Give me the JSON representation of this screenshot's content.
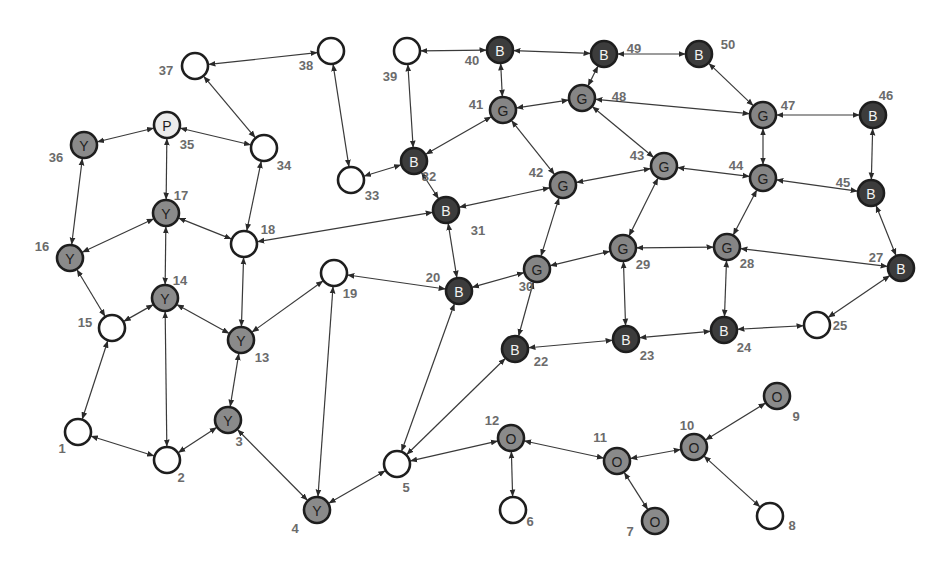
{
  "diagram": {
    "type": "undirected-graph-bidirectional-arrows",
    "node_radius": 13,
    "styles": {
      "Y": {
        "fill": "#8a8a8a",
        "stroke": "#1e1e1e",
        "text": "#1e1e1e"
      },
      "G": {
        "fill": "#858585",
        "stroke": "#1e1e1e",
        "text": "#1e1e1e"
      },
      "G-light": {
        "fill": "#8f8f8f",
        "stroke": "#8a8a8a",
        "text": "#1e1e1e"
      },
      "B": {
        "fill": "#3c3c3c",
        "stroke": "#1e1e1e",
        "text": "#f2f2f2"
      },
      "O": {
        "fill": "#8a8a8a",
        "stroke": "#1e1e1e",
        "text": "#1e1e1e"
      },
      "P": {
        "fill": "#ececec",
        "stroke": "#1e1e1e",
        "text": "#1e1e1e"
      },
      "empty": {
        "fill": "#ffffff",
        "stroke": "#1e1e1e",
        "text": "#1e1e1e"
      }
    },
    "nodes": [
      {
        "id": 1,
        "x": 78,
        "y": 432,
        "letter": "",
        "style": "empty",
        "lx": -16,
        "ly": 16
      },
      {
        "id": 2,
        "x": 167,
        "y": 460,
        "letter": "",
        "style": "empty",
        "lx": 14,
        "ly": 17
      },
      {
        "id": 3,
        "x": 228,
        "y": 420,
        "letter": "Y",
        "style": "Y",
        "lx": 11,
        "ly": 21
      },
      {
        "id": 4,
        "x": 317,
        "y": 510,
        "letter": "Y",
        "style": "Y",
        "lx": -22,
        "ly": 18
      },
      {
        "id": 5,
        "x": 397,
        "y": 464,
        "letter": "",
        "style": "empty",
        "lx": 9,
        "ly": 23
      },
      {
        "id": 6,
        "x": 513,
        "y": 510,
        "letter": "",
        "style": "empty",
        "lx": 17,
        "ly": 11
      },
      {
        "id": 7,
        "x": 655,
        "y": 521,
        "letter": "O",
        "style": "O",
        "lx": -25,
        "ly": 10
      },
      {
        "id": 8,
        "x": 770,
        "y": 516,
        "letter": "",
        "style": "empty",
        "lx": 22,
        "ly": 9
      },
      {
        "id": 9,
        "x": 777,
        "y": 396,
        "letter": "O",
        "style": "O",
        "lx": 19,
        "ly": 20
      },
      {
        "id": 10,
        "x": 694,
        "y": 447,
        "letter": "O",
        "style": "O",
        "lx": -7,
        "ly": -22
      },
      {
        "id": 11,
        "x": 617,
        "y": 461,
        "letter": "O",
        "style": "O",
        "lx": -17,
        "ly": -24
      },
      {
        "id": 12,
        "x": 511,
        "y": 438,
        "letter": "O",
        "style": "O",
        "lx": -19,
        "ly": -18
      },
      {
        "id": 13,
        "x": 241,
        "y": 340,
        "letter": "Y",
        "style": "Y",
        "lx": 21,
        "ly": 17
      },
      {
        "id": 14,
        "x": 165,
        "y": 298,
        "letter": "Y",
        "style": "Y",
        "lx": 15,
        "ly": -18
      },
      {
        "id": 15,
        "x": 112,
        "y": 328,
        "letter": "",
        "style": "empty",
        "lx": -27,
        "ly": -6
      },
      {
        "id": 16,
        "x": 70,
        "y": 258,
        "letter": "Y",
        "style": "Y",
        "lx": -28,
        "ly": -12
      },
      {
        "id": 17,
        "x": 166,
        "y": 213,
        "letter": "Y",
        "style": "Y",
        "lx": 15,
        "ly": -18
      },
      {
        "id": 18,
        "x": 244,
        "y": 244,
        "letter": "",
        "style": "empty",
        "lx": 24,
        "ly": -15
      },
      {
        "id": 19,
        "x": 334,
        "y": 273,
        "letter": "",
        "style": "empty",
        "lx": 16,
        "ly": 20
      },
      {
        "id": 20,
        "x": 459,
        "y": 291,
        "letter": "B",
        "style": "B",
        "lx": -26,
        "ly": -14
      },
      {
        "id": 22,
        "x": 515,
        "y": 349,
        "letter": "B",
        "style": "B",
        "lx": 26,
        "ly": 12
      },
      {
        "id": 23,
        "x": 626,
        "y": 339,
        "letter": "B",
        "style": "B",
        "lx": 21,
        "ly": 16
      },
      {
        "id": 24,
        "x": 724,
        "y": 330,
        "letter": "B",
        "style": "B",
        "lx": 20,
        "ly": 17
      },
      {
        "id": 25,
        "x": 817,
        "y": 325,
        "letter": "",
        "style": "empty",
        "lx": 23,
        "ly": 0
      },
      {
        "id": 27,
        "x": 901,
        "y": 268,
        "letter": "B",
        "style": "B",
        "lx": -25,
        "ly": -11
      },
      {
        "id": 28,
        "x": 727,
        "y": 247,
        "letter": "G",
        "style": "G",
        "lx": 20,
        "ly": 16
      },
      {
        "id": 29,
        "x": 623,
        "y": 248,
        "letter": "G",
        "style": "G",
        "lx": 20,
        "ly": 16
      },
      {
        "id": 30,
        "x": 537,
        "y": 269,
        "letter": "G",
        "style": "G",
        "lx": -11,
        "ly": 17
      },
      {
        "id": 31,
        "x": 446,
        "y": 210,
        "letter": "B",
        "style": "B",
        "lx": 32,
        "ly": 20
      },
      {
        "id": 32,
        "x": 414,
        "y": 161,
        "letter": "B",
        "style": "B",
        "lx": 15,
        "ly": 15
      },
      {
        "id": 33,
        "x": 351,
        "y": 180,
        "letter": "",
        "style": "empty",
        "lx": 21,
        "ly": 15
      },
      {
        "id": 34,
        "x": 264,
        "y": 148,
        "letter": "",
        "style": "empty",
        "lx": 20,
        "ly": 17
      },
      {
        "id": 35,
        "x": 167,
        "y": 125,
        "letter": "P",
        "style": "P",
        "lx": 20,
        "ly": 19
      },
      {
        "id": 36,
        "x": 84,
        "y": 145,
        "letter": "Y",
        "style": "Y",
        "lx": -28,
        "ly": 12
      },
      {
        "id": 37,
        "x": 195,
        "y": 66,
        "letter": "",
        "style": "empty",
        "lx": -29,
        "ly": 4
      },
      {
        "id": 38,
        "x": 331,
        "y": 51,
        "letter": "",
        "style": "empty",
        "lx": -25,
        "ly": 14
      },
      {
        "id": 39,
        "x": 407,
        "y": 51,
        "letter": "",
        "style": "empty",
        "lx": -17,
        "ly": 25
      },
      {
        "id": 40,
        "x": 500,
        "y": 50,
        "letter": "B",
        "style": "B",
        "lx": -28,
        "ly": 10
      },
      {
        "id": 41,
        "x": 503,
        "y": 110,
        "letter": "G",
        "style": "G",
        "lx": -27,
        "ly": -6
      },
      {
        "id": 42,
        "x": 563,
        "y": 185,
        "letter": "G",
        "style": "G",
        "lx": -27,
        "ly": -13
      },
      {
        "id": 43,
        "x": 664,
        "y": 166,
        "letter": "G",
        "style": "G-light",
        "lx": -27,
        "ly": -11
      },
      {
        "id": 44,
        "x": 763,
        "y": 178,
        "letter": "G",
        "style": "G",
        "lx": -27,
        "ly": -13
      },
      {
        "id": 45,
        "x": 871,
        "y": 193,
        "letter": "B",
        "style": "B",
        "lx": -28,
        "ly": -11
      },
      {
        "id": 46,
        "x": 873,
        "y": 115,
        "letter": "B",
        "style": "B",
        "lx": 13,
        "ly": -20
      },
      {
        "id": 47,
        "x": 763,
        "y": 115,
        "letter": "G",
        "style": "G",
        "lx": 25,
        "ly": -10
      },
      {
        "id": 48,
        "x": 582,
        "y": 98,
        "letter": "G",
        "style": "G",
        "lx": 37,
        "ly": -2
      },
      {
        "id": 49,
        "x": 604,
        "y": 54,
        "letter": "B",
        "style": "B",
        "lx": 30,
        "ly": -6
      },
      {
        "id": 50,
        "x": 699,
        "y": 54,
        "letter": "B",
        "style": "B",
        "lx": 29,
        "ly": -10
      }
    ],
    "edges": [
      [
        1,
        2
      ],
      [
        1,
        15
      ],
      [
        2,
        14
      ],
      [
        2,
        3
      ],
      [
        3,
        13
      ],
      [
        3,
        4
      ],
      [
        4,
        19
      ],
      [
        4,
        5
      ],
      [
        5,
        20
      ],
      [
        5,
        22
      ],
      [
        5,
        12
      ],
      [
        12,
        6
      ],
      [
        12,
        11
      ],
      [
        11,
        7
      ],
      [
        11,
        10
      ],
      [
        10,
        9
      ],
      [
        10,
        8
      ],
      [
        13,
        14
      ],
      [
        13,
        18
      ],
      [
        13,
        19
      ],
      [
        14,
        15
      ],
      [
        14,
        17
      ],
      [
        15,
        16
      ],
      [
        16,
        17
      ],
      [
        16,
        36
      ],
      [
        17,
        35
      ],
      [
        17,
        18
      ],
      [
        18,
        34
      ],
      [
        18,
        31
      ],
      [
        19,
        20
      ],
      [
        20,
        31
      ],
      [
        20,
        30
      ],
      [
        30,
        42
      ],
      [
        30,
        22
      ],
      [
        30,
        29
      ],
      [
        22,
        23
      ],
      [
        23,
        29
      ],
      [
        23,
        24
      ],
      [
        24,
        28
      ],
      [
        24,
        25
      ],
      [
        25,
        27
      ],
      [
        27,
        28
      ],
      [
        27,
        45
      ],
      [
        28,
        29
      ],
      [
        28,
        44
      ],
      [
        29,
        43
      ],
      [
        31,
        32
      ],
      [
        31,
        42
      ],
      [
        32,
        33
      ],
      [
        32,
        39
      ],
      [
        32,
        41
      ],
      [
        33,
        38
      ],
      [
        34,
        35
      ],
      [
        34,
        37
      ],
      [
        35,
        36
      ],
      [
        37,
        38
      ],
      [
        39,
        40
      ],
      [
        40,
        41
      ],
      [
        40,
        49
      ],
      [
        41,
        48
      ],
      [
        41,
        42
      ],
      [
        42,
        43
      ],
      [
        43,
        44
      ],
      [
        43,
        48
      ],
      [
        48,
        47
      ],
      [
        48,
        49
      ],
      [
        49,
        50
      ],
      [
        50,
        47
      ],
      [
        47,
        46
      ],
      [
        47,
        44
      ],
      [
        44,
        45
      ],
      [
        45,
        46
      ]
    ]
  }
}
